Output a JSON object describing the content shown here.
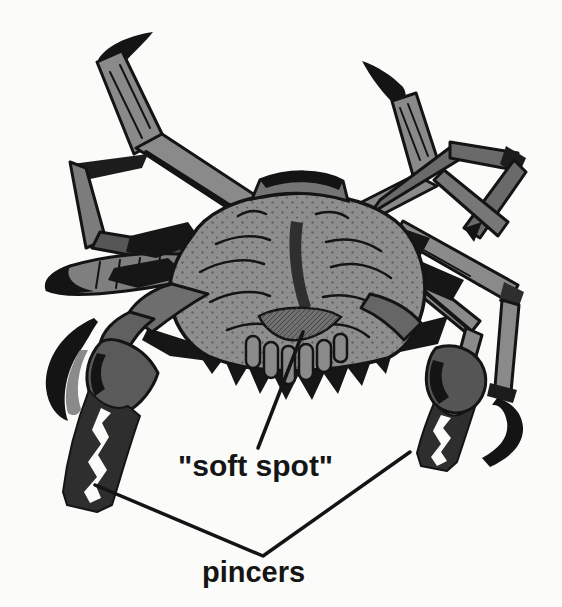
{
  "figure": {
    "labels": [
      {
        "id": "soft-spot",
        "text": "\"soft spot\""
      },
      {
        "id": "pincers",
        "text": "pincers"
      }
    ]
  },
  "colors": {
    "background": "#fbfbf9",
    "crab_gray": "#8e8e8e",
    "crab_mid_gray": "#707070",
    "crab_shadow_gray": "#5a5a5a",
    "ink_black": "#161616",
    "label_text": "#151515"
  }
}
